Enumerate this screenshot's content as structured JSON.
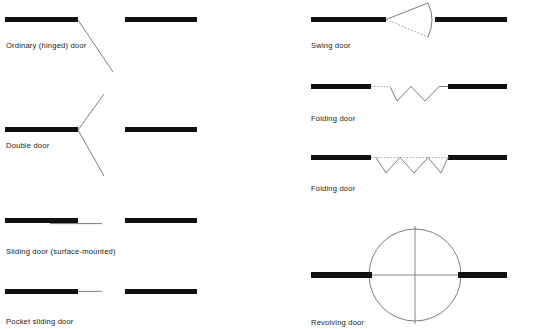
{
  "page": {
    "background_color": "#ffffff",
    "wall_color": "#111111",
    "line_color": "#6e6e6e",
    "text_color": "#1c1c1c"
  },
  "columns": {
    "left": {
      "symbols": [
        {
          "id": "ordinary-hinged-door",
          "label": "Ordinary (hinged) door",
          "type": "hinged",
          "leaves": 1,
          "caption_x": 6,
          "caption_y": 41,
          "walls": [
            {
              "x": 5,
              "y": 17,
              "w": 73,
              "h": 5
            },
            {
              "x": 125,
              "y": 17,
              "w": 72,
              "h": 5
            }
          ],
          "leaf_lines": [
            {
              "x1": 78,
              "y1": 20,
              "x2": 113,
              "y2": 72
            }
          ]
        },
        {
          "id": "double-door",
          "label": "Double door",
          "type": "hinged",
          "leaves": 2,
          "caption_x": 6,
          "caption_y": 141,
          "walls": [
            {
              "x": 5,
              "y": 127,
              "w": 73,
              "h": 5
            },
            {
              "x": 125,
              "y": 127,
              "w": 72,
              "h": 5
            }
          ],
          "leaf_lines": [
            {
              "x1": 78,
              "y1": 130,
              "x2": 104,
              "y2": 94
            },
            {
              "x1": 78,
              "y1": 130,
              "x2": 104,
              "y2": 176
            }
          ]
        },
        {
          "id": "sliding-door-surface-mounted",
          "label": "Sliding door (surface-mounted)",
          "type": "sliding",
          "caption_x": 6,
          "caption_y": 247,
          "walls": [
            {
              "x": 5,
              "y": 218,
              "w": 73,
              "h": 5
            },
            {
              "x": 125,
              "y": 218,
              "w": 72,
              "h": 5
            }
          ],
          "slide_lines": [
            {
              "x1": 50,
              "y1": 224,
              "x2": 102,
              "y2": 224
            }
          ]
        },
        {
          "id": "pocket-sliding-door",
          "label": "Pocket sliding door",
          "type": "sliding",
          "caption_x": 6,
          "caption_y": 317,
          "walls": [
            {
              "x": 5,
              "y": 289,
              "w": 73,
              "h": 5
            },
            {
              "x": 125,
              "y": 289,
              "w": 72,
              "h": 5
            }
          ],
          "slide_lines": [
            {
              "x1": 78,
              "y1": 291,
              "x2": 102,
              "y2": 291
            }
          ]
        }
      ]
    },
    "right": {
      "symbols": [
        {
          "id": "swing-door",
          "label": "Swing door",
          "type": "swing",
          "caption_x": 311,
          "caption_y": 41,
          "walls": [
            {
              "x": 311,
              "y": 17,
              "w": 75,
              "h": 5
            },
            {
              "x": 435,
              "y": 17,
              "w": 72,
              "h": 5
            }
          ],
          "pivot": {
            "x": 386,
            "y": 20
          },
          "leaf_solid": {
            "x1": 386,
            "y1": 20,
            "x2": 427,
            "y2": 3
          },
          "leaf_dotted": {
            "x1": 386,
            "y1": 20,
            "x2": 427,
            "y2": 38
          },
          "arc_radius": 44
        },
        {
          "id": "folding-door-1",
          "label": "Folding door",
          "type": "folding",
          "caption_x": 311,
          "caption_y": 114,
          "walls": [
            {
              "x": 311,
              "y": 84,
              "w": 60,
              "h": 5
            },
            {
              "x": 448,
              "y": 84,
              "w": 59,
              "h": 5
            }
          ],
          "track_dotted": {
            "x1": 371,
            "y1": 86,
            "x2": 390,
            "y2": 86
          },
          "zigzag": {
            "x_start": 390,
            "x_end": 448,
            "y_top": 86,
            "y_bottom": 101,
            "folds": 4
          }
        },
        {
          "id": "folding-door-2",
          "label": "Folding door",
          "type": "folding",
          "caption_x": 311,
          "caption_y": 184,
          "walls": [
            {
              "x": 311,
              "y": 155,
              "w": 60,
              "h": 5
            },
            {
              "x": 448,
              "y": 155,
              "w": 59,
              "h": 5
            }
          ],
          "track_dotted": {
            "x1": 371,
            "y1": 157,
            "x2": 448,
            "y2": 157
          },
          "zigzag": {
            "x_start": 376,
            "x_end": 448,
            "y_top": 157,
            "y_bottom": 173,
            "folds": 4
          }
        },
        {
          "id": "revolving-door",
          "label": "Revolving door",
          "type": "revolving",
          "caption_x": 311,
          "caption_y": 318,
          "walls": [
            {
              "x": 311,
              "y": 272,
              "w": 61,
              "h": 6
            },
            {
              "x": 458,
              "y": 272,
              "w": 49,
              "h": 6
            }
          ],
          "circle": {
            "cx": 415,
            "cy": 275,
            "r": 46
          },
          "cross": {
            "vertical": {
              "x": 415,
              "y1": 224,
              "y2": 326
            },
            "horizontal": {
              "y": 275,
              "x1": 366,
              "x2": 470
            }
          }
        }
      ]
    }
  }
}
